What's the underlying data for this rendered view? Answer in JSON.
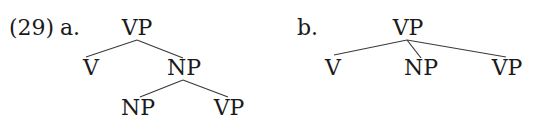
{
  "example": {
    "number": "(29)",
    "a": {
      "label": "a.",
      "root": "VP",
      "children": [
        "V",
        "NP"
      ],
      "np_children": [
        "NP",
        "VP"
      ]
    },
    "b": {
      "label": "b.",
      "root": "VP",
      "children": [
        "V",
        "NP",
        "VP"
      ]
    }
  }
}
